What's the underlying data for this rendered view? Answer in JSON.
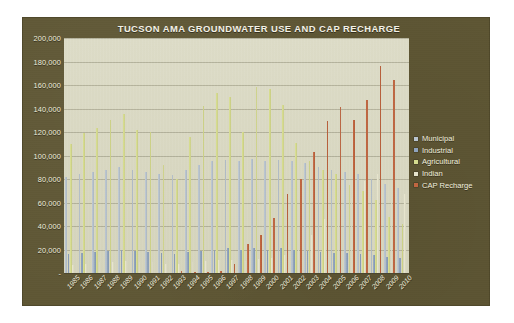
{
  "chart_data": {
    "type": "bar",
    "title": "TUCSON AMA GROUNDWATER USE AND CAP RECHARGE",
    "xlabel": "",
    "ylabel": "",
    "ylim": [
      0,
      200000
    ],
    "ytick_step": 20000,
    "grid": true,
    "legend_position": "right",
    "ytick_labels": [
      "200,000",
      "180,000",
      "160,000",
      "140,000",
      "120,000",
      "100,000",
      "80,000",
      "60,000",
      "40,000",
      "20,000",
      "-"
    ],
    "ytick_values": [
      200000,
      180000,
      160000,
      140000,
      120000,
      100000,
      80000,
      60000,
      40000,
      20000,
      0
    ],
    "categories": [
      "1985",
      "1986",
      "1987",
      "1988",
      "1989",
      "1990",
      "1991",
      "1992",
      "1993",
      "1994",
      "1995",
      "1996",
      "1997",
      "1998",
      "1999",
      "2000",
      "2001",
      "2002",
      "2003",
      "2004",
      "2005",
      "2006",
      "2007",
      "2008",
      "2009",
      "2010"
    ],
    "series": [
      {
        "name": "Municipal",
        "color": "#b9c4cf",
        "values": [
          82000,
          84000,
          86000,
          88000,
          90000,
          88000,
          86000,
          84000,
          83000,
          88000,
          92000,
          95000,
          96000,
          95000,
          97000,
          95000,
          96000,
          95000,
          94000,
          90000,
          88000,
          86000,
          84000,
          80000,
          76000,
          72000
        ]
      },
      {
        "name": "Industrial",
        "color": "#8fa3bd",
        "values": [
          16000,
          17000,
          18000,
          19000,
          20000,
          19000,
          18000,
          17000,
          16000,
          18000,
          19000,
          20000,
          21000,
          20000,
          21000,
          20000,
          21000,
          20000,
          19000,
          18000,
          17000,
          17000,
          16000,
          15000,
          14000,
          13000
        ]
      },
      {
        "name": "Agricultural",
        "color": "#d6dc8e",
        "values": [
          110000,
          119000,
          123000,
          130000,
          135000,
          122000,
          120000,
          92000,
          80000,
          116000,
          142000,
          153000,
          150000,
          120000,
          158000,
          157000,
          143000,
          111000,
          95000,
          88000,
          84000,
          75000,
          70000,
          62000,
          48000,
          42000
        ]
      },
      {
        "name": "Indian",
        "color": "#e6e4cc",
        "values": [
          7000,
          8000,
          9000,
          9000,
          10000,
          9000,
          9000,
          8000,
          8000,
          9000,
          10000,
          11000,
          11000,
          10000,
          12000,
          13000,
          15000,
          20000,
          32000,
          46000,
          60000,
          64000,
          78000,
          84000,
          62000,
          67000
        ]
      },
      {
        "name": "CAP Recharge",
        "color": "#c0653f",
        "values": [
          0,
          0,
          0,
          0,
          0,
          0,
          0,
          0,
          1500,
          1000,
          1200,
          2000,
          8000,
          25000,
          32000,
          47000,
          67000,
          80000,
          103000,
          129000,
          141000,
          130000,
          147000,
          176000,
          164000,
          0
        ]
      }
    ]
  },
  "legend": {
    "items": [
      {
        "label": "Municipal",
        "color": "#b9c4cf"
      },
      {
        "label": "Industrial",
        "color": "#8fa3bd"
      },
      {
        "label": "Agricultural",
        "color": "#d6dc8e"
      },
      {
        "label": "Indian",
        "color": "#e6e4cc"
      },
      {
        "label": "CAP Recharge",
        "color": "#c0653f"
      }
    ]
  },
  "theme": {
    "panel_background": "#5d5533",
    "plot_background": "#d9d8c2",
    "text_color": "#f1efdf",
    "gridline_color": "#787660"
  }
}
